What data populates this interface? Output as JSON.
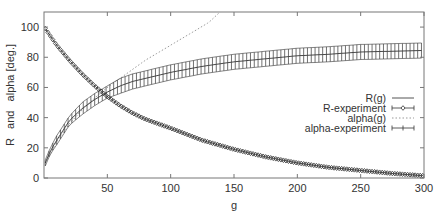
{
  "chart_data": {
    "type": "line",
    "title": "",
    "xlabel": "g",
    "ylabel": "R   and   alpha [deg.]",
    "xlim": [
      0,
      300
    ],
    "ylim": [
      0,
      110
    ],
    "xticks": [
      50,
      100,
      150,
      200,
      250,
      300
    ],
    "yticks": [
      0,
      20,
      40,
      60,
      80,
      100
    ],
    "grid": false,
    "legend_position": "right-middle-inside",
    "series": [
      {
        "name": "R(g)",
        "style": "solid",
        "color": "#555555",
        "x": [
          1,
          10,
          20,
          30,
          40,
          50,
          60,
          70,
          80,
          90,
          100,
          125,
          150,
          175,
          200,
          225,
          250,
          275,
          300
        ],
        "values": [
          99,
          88,
          78,
          69,
          61,
          54,
          48,
          43,
          39,
          36,
          33,
          25,
          19,
          14,
          10,
          7,
          5,
          3,
          1.5
        ]
      },
      {
        "name": "R-experiment",
        "style": "diamond-points-with-errorbars",
        "color": "#333333",
        "x": [
          1,
          10,
          20,
          30,
          40,
          50,
          60,
          70,
          80,
          90,
          100,
          125,
          150,
          175,
          200,
          225,
          250,
          275,
          300
        ],
        "values": [
          99,
          88,
          78,
          69,
          61,
          54,
          48,
          43,
          39,
          36,
          33,
          25,
          19,
          14,
          10,
          7,
          5,
          3,
          1.5
        ],
        "error": 1
      },
      {
        "name": "alpha(g)",
        "style": "dotted",
        "color": "#999999",
        "x": [
          1,
          10,
          20,
          30,
          40,
          50,
          60,
          70,
          80,
          90,
          100,
          110,
          120,
          130,
          139
        ],
        "values": [
          10,
          24,
          36,
          45,
          53,
          60,
          66,
          72,
          78,
          83,
          88,
          93,
          98,
          103,
          110
        ]
      },
      {
        "name": "alpha-experiment",
        "style": "errorbars",
        "color": "#333333",
        "x": [
          1,
          5,
          10,
          20,
          30,
          40,
          50,
          60,
          70,
          80,
          90,
          100,
          125,
          150,
          175,
          200,
          225,
          250,
          275,
          300
        ],
        "values": [
          10,
          18,
          25,
          38,
          46,
          52,
          57,
          61,
          64,
          66,
          68,
          70,
          74,
          77,
          79,
          81,
          82,
          83.5,
          84,
          84.5
        ],
        "error": [
          2,
          2,
          3,
          3,
          4,
          4,
          4,
          5,
          5,
          5,
          5,
          5,
          5,
          5,
          5,
          5,
          5,
          5,
          5,
          5
        ]
      }
    ]
  }
}
